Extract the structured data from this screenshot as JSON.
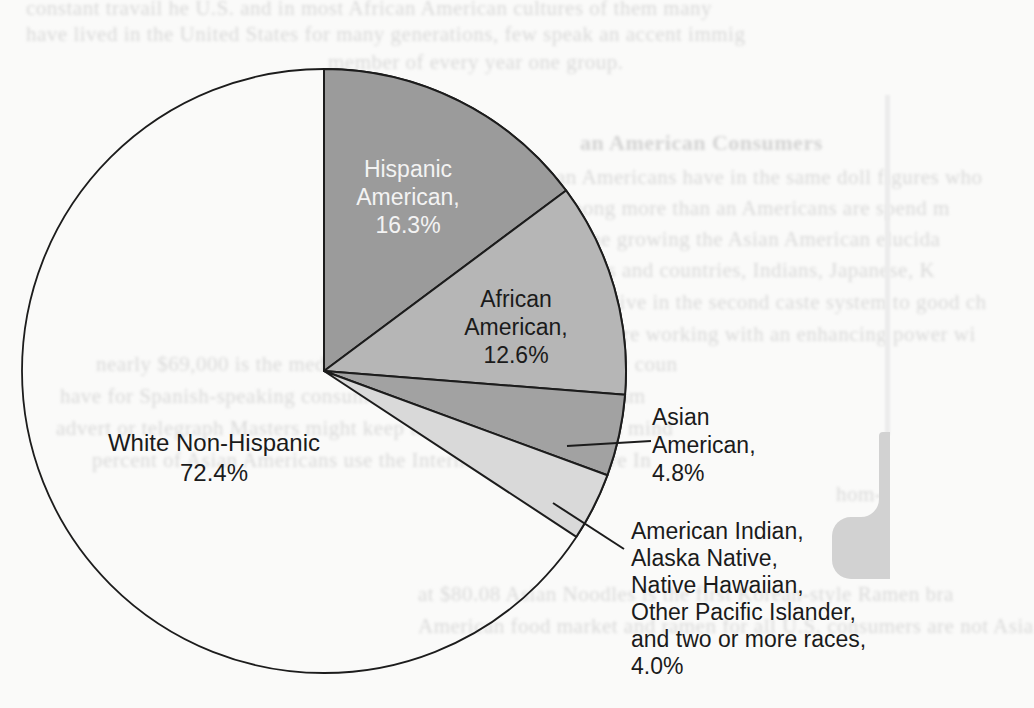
{
  "figure": {
    "kind": "scanned textbook page with pie chart",
    "background_color": "#fafaf9",
    "outline_color": "#1c1c1c"
  },
  "chart_data": {
    "type": "pie",
    "title": "",
    "legend_position": "none",
    "labels_on_chart": true,
    "note": "percent values as printed (sum to 110.1); drawn angles normalized",
    "categories": [
      "Hispanic American",
      "African American",
      "Asian American",
      "American Indian, Alaska Native, Native Hawaiian, Other Pacific Islander, and two or more races",
      "White Non-Hispanic"
    ],
    "values": [
      16.3,
      12.6,
      4.8,
      4.0,
      72.4
    ],
    "slices": [
      {
        "label": "Hispanic American",
        "value": 16.3,
        "color": "#9b9b9b",
        "label_color": "#f3f3f3",
        "text_lines": [
          "Hispanic",
          "American,",
          "16.3%"
        ]
      },
      {
        "label": "African American",
        "value": 12.6,
        "color": "#b6b6b6",
        "label_color": "#1b1b1b",
        "text_lines": [
          "African",
          "American,",
          "12.6%"
        ]
      },
      {
        "label": "Asian American",
        "value": 4.8,
        "color": "#a2a2a2",
        "label_color": "#1b1b1b",
        "text_lines": [
          "Asian",
          "American,",
          "4.8%"
        ]
      },
      {
        "label": "American Indian, Alaska Native, Native Hawaiian, Other Pacific Islander, and two or more races",
        "value": 4.0,
        "color": "#d9d9d9",
        "label_color": "#1b1b1b",
        "text_lines": [
          "American Indian,",
          "Alaska Native,",
          "Native Hawaiian,",
          "Other Pacific Islander,",
          "and two or more races,",
          "4.0%"
        ]
      },
      {
        "label": "White Non-Hispanic",
        "value": 72.4,
        "color": "#ffffff",
        "label_color": "#1b1b1b",
        "text_lines": [
          "White Non-Hispanic",
          "72.4%"
        ]
      }
    ],
    "drawn_angles_clockwise_from_12": [
      {
        "slice": "Hispanic American",
        "start": 0,
        "end": 53.3
      },
      {
        "slice": "African American",
        "start": 53.3,
        "end": 94.5
      },
      {
        "slice": "Asian American",
        "start": 94.5,
        "end": 110.2
      },
      {
        "slice": "American Indian / Alaska Native / Native Hawaiian / Other Pacific Islander / two or more races",
        "start": 110.2,
        "end": 123.3
      },
      {
        "slice": "White Non-Hispanic",
        "start": 123.3,
        "end": 360
      }
    ]
  },
  "side_tab": {
    "color": "#d2d2d2"
  },
  "bleed_text": {
    "description": "blurred bleed-through body text from the scanned page (mostly illegible)",
    "fragments": [
      {
        "x": 26,
        "y": -4,
        "bold": false,
        "text": "constant travail he U.S. and in most African American cultures of them many"
      },
      {
        "x": 26,
        "y": 22,
        "bold": false,
        "text": "have lived in the United States for many generations, few speak an accent immig"
      },
      {
        "x": 328,
        "y": 50,
        "bold": false,
        "text": "member of every year one group."
      },
      {
        "x": 580,
        "y": 130,
        "bold": true,
        "text": "an American Consumers"
      },
      {
        "x": 556,
        "y": 165,
        "bold": false,
        "text": "an Americans have in the same doll figures who"
      },
      {
        "x": 556,
        "y": 196,
        "bold": false,
        "text": "among more than an Americans are spend m"
      },
      {
        "x": 556,
        "y": 227,
        "bold": false,
        "text": "by the growing the Asian American elucida"
      },
      {
        "x": 556,
        "y": 258,
        "bold": false,
        "text": "groups and countries, Indians, Japanese, K"
      },
      {
        "x": 556,
        "y": 290,
        "bold": false,
        "text": "gangs live in the second caste system to good ch"
      },
      {
        "x": 552,
        "y": 322,
        "bold": false,
        "text": "cans were working with an enhancing power wi"
      },
      {
        "x": 96,
        "y": 352,
        "bold": false,
        "text": "nearly $69,000 is the median income for the Asian Hispanic coun"
      },
      {
        "x": 60,
        "y": 384,
        "bold": false,
        "text": "have for Spanish-speaking consumers with 20 percent of them am"
      },
      {
        "x": 56,
        "y": 416,
        "bold": false,
        "text": "advert or telegraph Masters might keep the following may be in mind"
      },
      {
        "x": 92,
        "y": 448,
        "bold": false,
        "text": "percent of Asian Americans use the Internet 80 percent have In"
      },
      {
        "x": 836,
        "y": 482,
        "bold": false,
        "text": "hom-"
      },
      {
        "x": 836,
        "y": 545,
        "bold": false,
        "text": "Asia"
      },
      {
        "x": 418,
        "y": 582,
        "bold": false,
        "text": "at $80.08 Asian Noodles is the first Korean-style Ramen bra"
      },
      {
        "x": 418,
        "y": 614,
        "bold": false,
        "text": "American food market and ramen for all U.S. consumers are not Asia"
      }
    ]
  }
}
